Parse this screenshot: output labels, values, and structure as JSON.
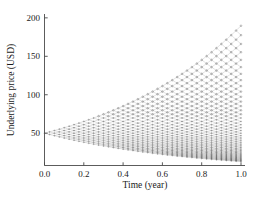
{
  "chart_data": {
    "type": "line",
    "title": "",
    "subtitle": "",
    "xlabel": "Time (year)",
    "ylabel": "Underlying price (USD)",
    "xlim": [
      0.0,
      1.0
    ],
    "ylim": [
      8,
      205
    ],
    "xticks": [
      0.0,
      0.2,
      0.4,
      0.6,
      0.8,
      1.0
    ],
    "xtick_labels": [
      "0.0",
      "0.2",
      "0.4",
      "0.6",
      "0.8",
      "1.0"
    ],
    "yticks": [
      50,
      100,
      150,
      200
    ],
    "ytick_labels": [
      "50",
      "100",
      "150",
      "200"
    ],
    "grid": false,
    "legend": null,
    "annotations": [],
    "lattice": {
      "initial_price": 50,
      "steps": 40,
      "time_horizon": 1.0,
      "up_factor": 1.0339,
      "down_factor": 0.9672,
      "terminal_max": 190,
      "terminal_min": 13,
      "node_marker": "open-circle",
      "edge_color": "#777777",
      "node_color": "#333333"
    }
  },
  "axes": {
    "x_title": "Time (year)",
    "y_title": "Underlying price (USD)"
  },
  "colors": {
    "background": "#ffffff",
    "axis": "#4a4a4a",
    "text": "#1a1a1a",
    "edge": "#777777",
    "node": "#333333"
  }
}
